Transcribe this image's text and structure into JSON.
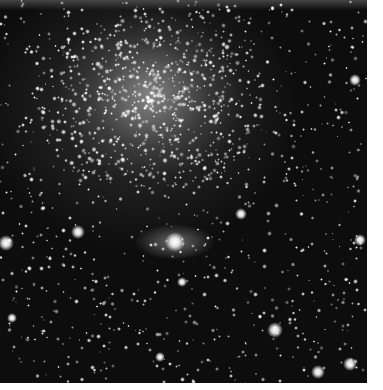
{
  "image": {
    "subject": "star cluster",
    "palette": {
      "background": "#0d0d0d",
      "core": "#c8c8c8",
      "star": "#ffffff",
      "page": "#ffffff"
    },
    "bright_stars": [
      {
        "x": 175,
        "y": 242,
        "r": 10
      },
      {
        "x": 78,
        "y": 232,
        "r": 7
      },
      {
        "x": 6,
        "y": 243,
        "r": 8
      },
      {
        "x": 360,
        "y": 240,
        "r": 6
      },
      {
        "x": 241,
        "y": 214,
        "r": 6
      },
      {
        "x": 275,
        "y": 330,
        "r": 8
      },
      {
        "x": 318,
        "y": 372,
        "r": 7
      },
      {
        "x": 350,
        "y": 364,
        "r": 7
      },
      {
        "x": 12,
        "y": 318,
        "r": 5
      },
      {
        "x": 182,
        "y": 282,
        "r": 5
      },
      {
        "x": 355,
        "y": 80,
        "r": 6
      },
      {
        "x": 160,
        "y": 357,
        "r": 5
      }
    ]
  }
}
